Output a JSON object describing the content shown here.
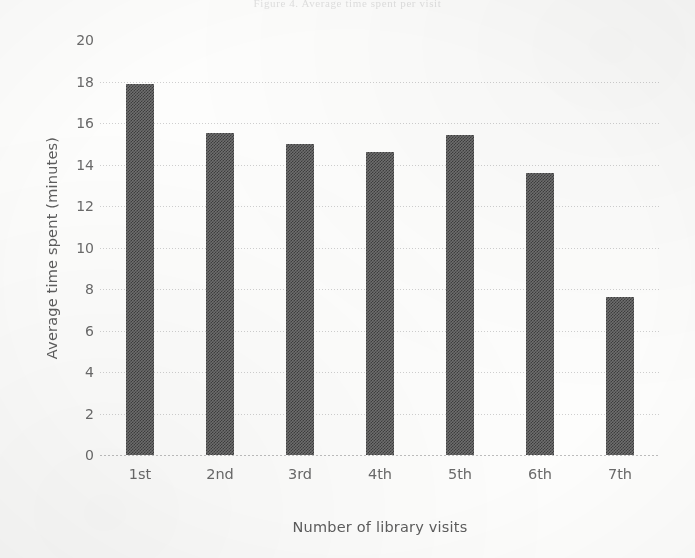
{
  "page": {
    "cropped_top_caption": "Figure 4.  Average time spent per visit"
  },
  "chart_data": {
    "type": "bar",
    "title": "",
    "subtitle": "",
    "xlabel": "Number of library visits",
    "ylabel": "Average time spent (minutes)",
    "categories": [
      "1st",
      "2nd",
      "3rd",
      "4th",
      "5th",
      "6th",
      "7th"
    ],
    "values": [
      17.9,
      15.5,
      15.0,
      14.6,
      15.4,
      13.6,
      7.6
    ],
    "ylim": [
      0,
      20
    ],
    "y_ticks": [
      20,
      18,
      16,
      14,
      12,
      10,
      8,
      6,
      4,
      2,
      0
    ],
    "y_tick_labels": [
      "20",
      "18",
      "16",
      "14",
      "12",
      "10",
      "8",
      "6",
      "4",
      "2",
      "0"
    ],
    "grid": "horizontal-dotted",
    "legend": "none",
    "bar_color": "#6f6f6f",
    "bar_pattern_dark": "#3d3d3d",
    "bar_pattern_light": "#9a9a9a",
    "gridline_color": "#cfcfcf",
    "axis_text_color": "#6a6a6a",
    "annotations": []
  }
}
